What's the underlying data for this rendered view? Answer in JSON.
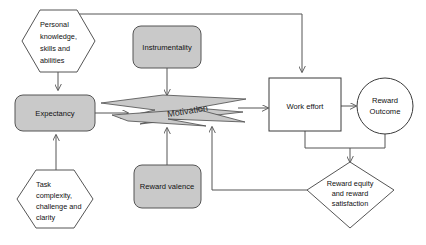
{
  "diagram": {
    "colors": {
      "node_fill_gray": "#c9c9c9",
      "node_fill_white": "#ffffff",
      "stroke": "#555555",
      "text": "#111111",
      "background": "#ffffff"
    },
    "nodes": {
      "personal_knowledge": {
        "shape": "hexagon",
        "fill": "#ffffff",
        "lines": [
          "Personal",
          "knowledge,",
          "skills and",
          "abilities"
        ]
      },
      "task_complexity": {
        "shape": "hexagon",
        "fill": "#ffffff",
        "lines": [
          "Task",
          "complexity,",
          "challenge and",
          "clarity"
        ]
      },
      "instrumentality": {
        "shape": "rounded-rect",
        "fill": "#c9c9c9",
        "label": "Instrumentality"
      },
      "reward_valence": {
        "shape": "rounded-rect",
        "fill": "#c9c9c9",
        "label": "Reward valence"
      },
      "expectancy": {
        "shape": "rounded-rect",
        "fill": "#c9c9c9",
        "label": "Expectancy"
      },
      "motivation": {
        "shape": "lightning-bolt-banner",
        "fill": "#c9c9c9",
        "label": "Motivation"
      },
      "work_effort": {
        "shape": "rect",
        "fill": "#ffffff",
        "label": "Work effort"
      },
      "reward_outcome": {
        "shape": "circle",
        "fill": "#ffffff",
        "lines": [
          "Reward",
          "Outcome"
        ]
      },
      "reward_equity": {
        "shape": "diamond",
        "fill": "#ffffff",
        "lines": [
          "Reward equity",
          "and reward",
          "satisfaction"
        ]
      }
    },
    "connections": [
      {
        "from": "personal_knowledge",
        "to": "expectancy",
        "style": "arrow-down"
      },
      {
        "from": "task_complexity",
        "to": "expectancy",
        "style": "arrow-up"
      },
      {
        "from": "expectancy",
        "to": "motivation",
        "style": "arrow-right"
      },
      {
        "from": "instrumentality",
        "to": "motivation",
        "style": "arrow-down"
      },
      {
        "from": "reward_valence",
        "to": "motivation",
        "style": "arrow-up"
      },
      {
        "from": "motivation",
        "to": "work_effort",
        "style": "arrow-right"
      },
      {
        "from": "personal_knowledge",
        "to": "work_effort",
        "style": "elbow-arrow-top"
      },
      {
        "from": "work_effort",
        "to": "reward_outcome",
        "style": "arrow-right"
      },
      {
        "from": "work_effort",
        "to": "reward_equity",
        "style": "elbow-arrow-down"
      },
      {
        "from": "reward_outcome",
        "to": "reward_equity",
        "style": "elbow-arrow-down"
      },
      {
        "from": "reward_equity",
        "to": "motivation",
        "style": "feedback-elbow-arrow-up"
      }
    ]
  }
}
